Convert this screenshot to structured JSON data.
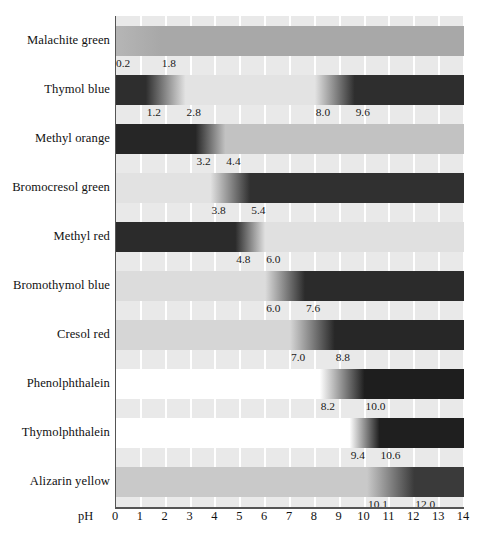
{
  "chart_data": {
    "type": "bar",
    "title": "",
    "xlabel": "pH",
    "ylabel": "",
    "xlim": [
      0,
      14
    ],
    "grid": true,
    "legend": false,
    "tick_labels": [
      "0",
      "1",
      "2",
      "3",
      "4",
      "5",
      "6",
      "7",
      "8",
      "9",
      "10",
      "11",
      "12",
      "13",
      "14"
    ],
    "categories": [
      "Malachite green",
      "Thymol blue",
      "Methyl orange",
      "Bromocresol green",
      "Methyl red",
      "Bromothymol blue",
      "Cresol red",
      "Phenolphthalein",
      "Thymolphthalein",
      "Alizarin yellow"
    ],
    "series": [
      {
        "name": "Malachite green",
        "transitions": [
          [
            0.2,
            1.8
          ]
        ],
        "endpoint_labels": [
          "0.2",
          "1.8"
        ],
        "acid_color": "#b4b4b4",
        "base_color": "#a8a8a8"
      },
      {
        "name": "Thymol blue",
        "transitions": [
          [
            1.2,
            2.8
          ],
          [
            8.0,
            9.6
          ]
        ],
        "endpoint_labels": [
          "1.2",
          "2.8",
          "8.0",
          "9.6"
        ],
        "acid_color": "#2e2e2e",
        "base_color": "#2e2e2e"
      },
      {
        "name": "Methyl orange",
        "transitions": [
          [
            3.2,
            4.4
          ]
        ],
        "endpoint_labels": [
          "3.2",
          "4.4"
        ],
        "acid_color": "#262626",
        "base_color": "#c2c2c2"
      },
      {
        "name": "Bromocresol green",
        "transitions": [
          [
            3.8,
            5.4
          ]
        ],
        "endpoint_labels": [
          "3.8",
          "5.4"
        ],
        "acid_color": "#e2e2e2",
        "base_color": "#303030"
      },
      {
        "name": "Methyl red",
        "transitions": [
          [
            4.8,
            6.0
          ]
        ],
        "endpoint_labels": [
          "4.8",
          "6.0"
        ],
        "acid_color": "#2b2b2b",
        "base_color": "#e0e0e0"
      },
      {
        "name": "Bromothymol blue",
        "transitions": [
          [
            6.0,
            7.6
          ]
        ],
        "endpoint_labels": [
          "6.0",
          "7.6"
        ],
        "acid_color": "#dcdcdc",
        "base_color": "#2b2b2b"
      },
      {
        "name": "Cresol red",
        "transitions": [
          [
            7.0,
            8.8
          ]
        ],
        "endpoint_labels": [
          "7.0",
          "8.8"
        ],
        "acid_color": "#d6d6d6",
        "base_color": "#272727"
      },
      {
        "name": "Phenolphthalein",
        "transitions": [
          [
            8.2,
            10.0
          ]
        ],
        "endpoint_labels": [
          "8.2",
          "10.0"
        ],
        "acid_color": "#ffffff",
        "base_color": "#1e1e1e"
      },
      {
        "name": "Thymolphthalein",
        "transitions": [
          [
            9.4,
            10.6
          ]
        ],
        "endpoint_labels": [
          "9.4",
          "10.6"
        ],
        "acid_color": "#ffffff",
        "base_color": "#1f1f1f"
      },
      {
        "name": "Alizarin yellow",
        "transitions": [
          [
            10.1,
            12.0
          ]
        ],
        "endpoint_labels": [
          "10.1",
          "12.0"
        ],
        "acid_color": "#c9c9c9",
        "base_color": "#3a3a3a"
      }
    ]
  },
  "axis": {
    "title": "pH",
    "ticks": [
      "0",
      "1",
      "2",
      "3",
      "4",
      "5",
      "6",
      "7",
      "8",
      "9",
      "10",
      "11",
      "12",
      "13",
      "14"
    ]
  },
  "colors": {
    "plot_background": "#e9e9e9",
    "gridline": "#ffffff",
    "axis": "#555555",
    "text": "#111111"
  }
}
